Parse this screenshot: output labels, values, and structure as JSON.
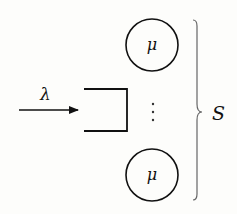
{
  "diagram": {
    "arrival": {
      "label": "λ"
    },
    "queue": {
      "kind": "buffer"
    },
    "servers": [
      {
        "label": "μ",
        "position": "top"
      },
      {
        "label": "μ",
        "position": "bottom"
      }
    ],
    "ellipsis": "⋮",
    "brace": {
      "label": "S"
    },
    "colors": {
      "stroke": "#111111",
      "brace": "#666666",
      "background": "#fdfdfb"
    }
  }
}
